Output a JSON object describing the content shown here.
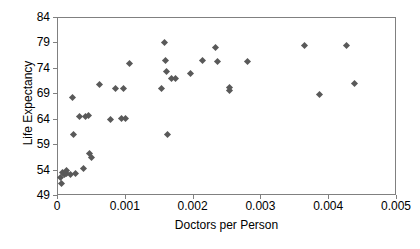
{
  "chart_data": {
    "type": "scatter",
    "title": "",
    "xlabel": "Doctors per Person",
    "ylabel": "Life Expectancy",
    "xlim": [
      0,
      0.005
    ],
    "ylim": [
      49,
      84
    ],
    "xticks": [
      "0",
      "0.001",
      "0.002",
      "0.003",
      "0.004",
      "0.005"
    ],
    "xtick_values": [
      0,
      0.001,
      0.002,
      0.003,
      0.004,
      0.005
    ],
    "yticks": [
      "84",
      "79",
      "74",
      "69",
      "64",
      "59",
      "54",
      "49"
    ],
    "ytick_values": [
      84,
      79,
      74,
      69,
      64,
      59,
      54,
      49
    ],
    "grid": false,
    "legend": false,
    "marker": "diamond",
    "marker_color": "#595959",
    "points": [
      {
        "x": 4e-05,
        "y": 52.6
      },
      {
        "x": 5e-05,
        "y": 51.4
      },
      {
        "x": 7e-05,
        "y": 53.6
      },
      {
        "x": 0.0001,
        "y": 53.2
      },
      {
        "x": 0.00012,
        "y": 53.5
      },
      {
        "x": 0.00013,
        "y": 54.0
      },
      {
        "x": 0.00018,
        "y": 53.2
      },
      {
        "x": 0.00021,
        "y": 68.4
      },
      {
        "x": 0.00023,
        "y": 61.1
      },
      {
        "x": 0.00026,
        "y": 53.4
      },
      {
        "x": 0.00031,
        "y": 64.6
      },
      {
        "x": 0.00037,
        "y": 54.5
      },
      {
        "x": 0.00041,
        "y": 64.7
      },
      {
        "x": 0.00045,
        "y": 64.8
      },
      {
        "x": 0.00047,
        "y": 57.4
      },
      {
        "x": 0.0005,
        "y": 56.5
      },
      {
        "x": 0.00061,
        "y": 70.9
      },
      {
        "x": 0.00077,
        "y": 64.1
      },
      {
        "x": 0.00085,
        "y": 70.2
      },
      {
        "x": 0.00093,
        "y": 64.2
      },
      {
        "x": 0.00096,
        "y": 70.2
      },
      {
        "x": 0.00099,
        "y": 64.2
      },
      {
        "x": 0.00106,
        "y": 75.0
      },
      {
        "x": 0.00153,
        "y": 70.1
      },
      {
        "x": 0.00157,
        "y": 79.1
      },
      {
        "x": 0.00159,
        "y": 75.7
      },
      {
        "x": 0.0016,
        "y": 73.5
      },
      {
        "x": 0.00161,
        "y": 61.1
      },
      {
        "x": 0.00167,
        "y": 72.2
      },
      {
        "x": 0.00174,
        "y": 72.2
      },
      {
        "x": 0.00196,
        "y": 73.1
      },
      {
        "x": 0.00213,
        "y": 75.6
      },
      {
        "x": 0.00233,
        "y": 78.2
      },
      {
        "x": 0.00235,
        "y": 75.5
      },
      {
        "x": 0.00253,
        "y": 69.8
      },
      {
        "x": 0.00253,
        "y": 70.4
      },
      {
        "x": 0.0028,
        "y": 75.4
      },
      {
        "x": 0.00364,
        "y": 78.6
      },
      {
        "x": 0.00385,
        "y": 69.0
      },
      {
        "x": 0.00425,
        "y": 78.6
      },
      {
        "x": 0.00437,
        "y": 71.2
      }
    ]
  }
}
